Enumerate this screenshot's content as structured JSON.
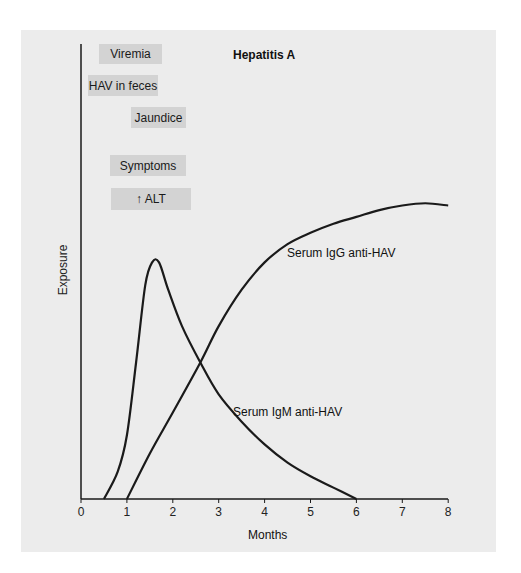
{
  "chart_data": {
    "type": "line",
    "title": "Hepatitis A",
    "xlabel": "Months",
    "ylabel": "Exposure",
    "xlim": [
      0,
      8
    ],
    "ylim": [
      0,
      1
    ],
    "x_ticks": [
      "0",
      "1",
      "2",
      "3",
      "4",
      "5",
      "6",
      "7",
      "8"
    ],
    "grid": false,
    "series": [
      {
        "name": "Serum IgM anti-HAV",
        "points": [
          [
            0.5,
            0.0
          ],
          [
            0.8,
            0.06
          ],
          [
            1.0,
            0.14
          ],
          [
            1.2,
            0.3
          ],
          [
            1.4,
            0.47
          ],
          [
            1.55,
            0.52
          ],
          [
            1.7,
            0.52
          ],
          [
            1.9,
            0.46
          ],
          [
            2.2,
            0.38
          ],
          [
            2.6,
            0.3
          ],
          [
            3.0,
            0.23
          ],
          [
            3.5,
            0.17
          ],
          [
            4.0,
            0.12
          ],
          [
            4.5,
            0.08
          ],
          [
            5.0,
            0.05
          ],
          [
            5.5,
            0.025
          ],
          [
            6.0,
            0.0
          ]
        ]
      },
      {
        "name": "Serum IgG anti-HAV",
        "points": [
          [
            1.0,
            0.0
          ],
          [
            1.5,
            0.1
          ],
          [
            2.0,
            0.19
          ],
          [
            2.6,
            0.3
          ],
          [
            3.0,
            0.38
          ],
          [
            3.5,
            0.46
          ],
          [
            4.0,
            0.52
          ],
          [
            4.5,
            0.56
          ],
          [
            5.0,
            0.585
          ],
          [
            5.5,
            0.605
          ],
          [
            6.0,
            0.62
          ],
          [
            6.5,
            0.635
          ],
          [
            7.0,
            0.645
          ],
          [
            7.5,
            0.65
          ],
          [
            8.0,
            0.645
          ]
        ]
      }
    ],
    "phase_labels": [
      {
        "label": "Viremia"
      },
      {
        "label": "HAV in feces"
      },
      {
        "label": "Jaundice"
      },
      {
        "label": "Symptoms"
      },
      {
        "label": "↑ ALT"
      }
    ],
    "annotations": [
      "Serum IgG anti-HAV",
      "Serum IgM anti-HAV"
    ]
  },
  "colors": {
    "panel": "#ececec",
    "phase_box": "#d3d3d3",
    "line": "#1a1a1a"
  }
}
